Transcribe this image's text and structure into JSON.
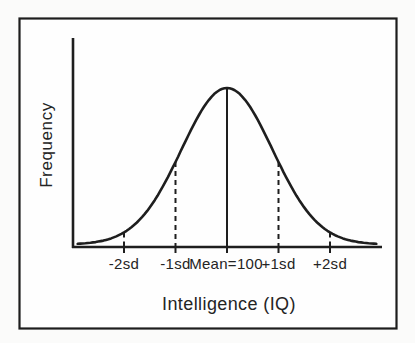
{
  "figure": {
    "ylabel": "Frequency",
    "xlabel": "Intelligence (IQ)",
    "tick_labels": [
      "-2sd",
      "-1sd",
      "Mean=100",
      "+1sd",
      "+2sd"
    ],
    "colors": {
      "ink": "#1e1e1e",
      "paper": "#fefefe",
      "page_background": "#fbfbfa"
    }
  },
  "chart_data": {
    "type": "line",
    "title": "",
    "xlabel": "Intelligence (IQ)",
    "ylabel": "Frequency",
    "x_tick_labels": [
      "-2sd",
      "-1sd",
      "Mean=100",
      "+1sd",
      "+2sd"
    ],
    "x_ticks_sd": [
      -2,
      -1,
      0,
      1,
      2
    ],
    "mean": 100,
    "y_axis_numeric": false,
    "grid": false,
    "legend": false,
    "curve": {
      "shape": "gaussian-bell",
      "k": 0.64,
      "half_range_sd": 2.9,
      "samples_sd": [
        -3,
        -2.5,
        -2,
        -1.5,
        -1,
        -0.5,
        0,
        0.5,
        1,
        1.5,
        2,
        2.5,
        3
      ],
      "samples_rel_frequency": [
        0.003,
        0.018,
        0.077,
        0.237,
        0.527,
        0.852,
        1.0,
        0.852,
        0.527,
        0.237,
        0.077,
        0.018,
        0.003
      ]
    },
    "markers": [
      {
        "label": "-2sd",
        "sd": -2,
        "line": "dashed"
      },
      {
        "label": "-1sd",
        "sd": -1,
        "line": "dashed"
      },
      {
        "label": "Mean=100",
        "sd": 0,
        "line": "solid"
      },
      {
        "label": "+1sd",
        "sd": 1,
        "line": "dashed"
      },
      {
        "label": "+2sd",
        "sd": 2,
        "line": "dashed"
      }
    ]
  }
}
